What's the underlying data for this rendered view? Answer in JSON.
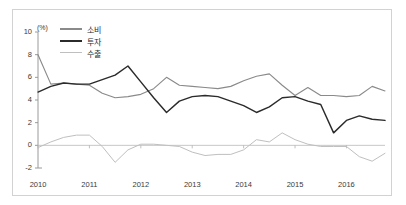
{
  "axis_unit": "(%)",
  "legend": [
    {
      "label": "소비",
      "color": "#8a8a8a",
      "width": 1.5
    },
    {
      "label": "투자",
      "color": "#2b2b2b",
      "width": 1.9
    },
    {
      "label": "수출",
      "color": "#bfbfbf",
      "width": 1.3
    }
  ],
  "chart_data": {
    "type": "line",
    "title": "",
    "subtitle": "",
    "xlabel": "",
    "ylabel": "(%)",
    "ylim": [
      -2,
      10
    ],
    "xlim": [
      2010.0,
      2016.75
    ],
    "yticks": [
      10,
      8,
      6,
      4,
      2,
      0,
      -2
    ],
    "ytick_labels": [
      "10",
      "8",
      "6",
      "4",
      "2",
      "0",
      "-2"
    ],
    "xticks": [
      2010,
      2011,
      2012,
      2013,
      2014,
      2015,
      2016
    ],
    "xtick_labels": [
      "2010",
      "2011",
      "2012",
      "2013",
      "2014",
      "2015",
      "2016"
    ],
    "grid": false,
    "zero_line": true,
    "legend_position": "top-left",
    "x": [
      2010.0,
      2010.25,
      2010.5,
      2010.75,
      2011.0,
      2011.25,
      2011.5,
      2011.75,
      2012.0,
      2012.25,
      2012.5,
      2012.75,
      2013.0,
      2013.25,
      2013.5,
      2013.75,
      2014.0,
      2014.25,
      2014.5,
      2014.75,
      2015.0,
      2015.25,
      2015.5,
      2015.75,
      2016.0,
      2016.25,
      2016.5,
      2016.75
    ],
    "series": [
      {
        "name": "소비",
        "color": "#8a8a8a",
        "values": [
          8.0,
          5.4,
          5.5,
          5.4,
          5.3,
          4.6,
          4.2,
          4.3,
          4.5,
          5.0,
          6.0,
          5.3,
          5.2,
          5.1,
          5.0,
          5.2,
          5.7,
          6.1,
          6.3,
          5.3,
          4.4,
          5.1,
          4.4,
          4.4,
          4.3,
          4.4,
          5.2,
          4.8
        ]
      },
      {
        "name": "투자",
        "color": "#2b2b2b",
        "values": [
          4.7,
          5.2,
          5.5,
          5.4,
          5.4,
          5.8,
          6.2,
          7.0,
          5.6,
          4.2,
          2.9,
          3.9,
          4.3,
          4.4,
          4.3,
          3.9,
          3.5,
          2.9,
          3.4,
          4.2,
          4.3,
          3.9,
          3.6,
          1.1,
          2.2,
          2.6,
          2.3,
          2.2
        ]
      },
      {
        "name": "수출",
        "color": "#bfbfbf",
        "values": [
          -0.2,
          0.3,
          0.7,
          0.9,
          0.9,
          -0.1,
          -1.5,
          -0.4,
          0.1,
          0.1,
          0.0,
          -0.1,
          -0.6,
          -0.9,
          -0.8,
          -0.8,
          -0.4,
          0.5,
          0.3,
          1.1,
          0.5,
          0.1,
          -0.1,
          -0.1,
          -0.1,
          -1.0,
          -1.4,
          -0.7
        ]
      }
    ]
  }
}
